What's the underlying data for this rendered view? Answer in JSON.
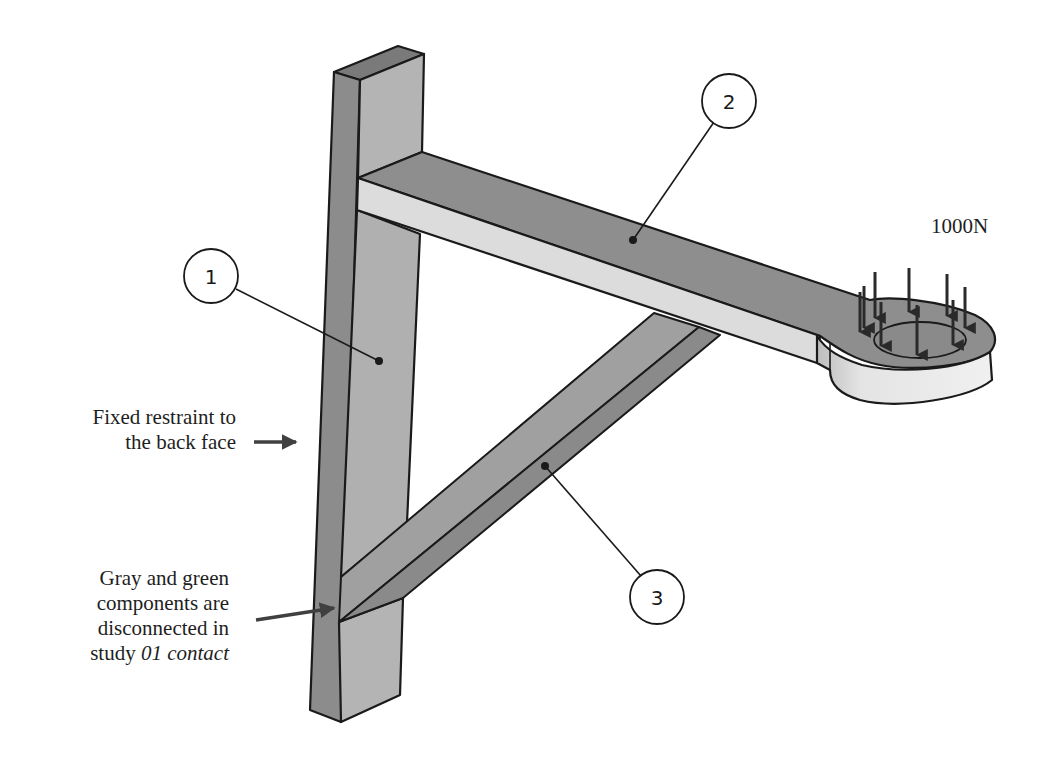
{
  "figure": {
    "type": "engineering-assembly-diagram"
  },
  "colors": {
    "background": "#ffffff",
    "outline": "#1a1a1a",
    "face_dark": "#8c8c8c",
    "face_mid": "#a8a8a8",
    "face_light": "#dadada",
    "arrow": "#404040"
  },
  "callouts": [
    {
      "number": "1",
      "target": "vertical-post"
    },
    {
      "number": "2",
      "target": "horizontal-arm"
    },
    {
      "number": "3",
      "target": "diagonal-strut"
    }
  ],
  "load": {
    "label": "1000N",
    "arrow_count": 9
  },
  "annotations": {
    "fixed_restraint": {
      "line1": "Fixed restraint to",
      "line2": "the back face"
    },
    "disconnected": {
      "line1": "Gray and green",
      "line2": "components are",
      "line3": "disconnected in",
      "line4_prefix": "study ",
      "line4_italic": "01 contact"
    }
  }
}
